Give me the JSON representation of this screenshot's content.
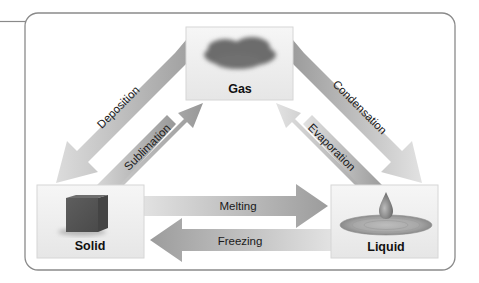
{
  "diagram": {
    "states": {
      "gas": {
        "label": "Gas",
        "icon": "cloud-icon"
      },
      "solid": {
        "label": "Solid",
        "icon": "cube-icon"
      },
      "liquid": {
        "label": "Liquid",
        "icon": "droplet-icon"
      }
    },
    "transitions": {
      "deposition": {
        "label": "Deposition",
        "from": "Gas",
        "to": "Solid"
      },
      "sublimation": {
        "label": "Sublimation",
        "from": "Solid",
        "to": "Gas"
      },
      "condensation": {
        "label": "Condensation",
        "from": "Gas",
        "to": "Liquid"
      },
      "evaporation": {
        "label": "Evaporation",
        "from": "Liquid",
        "to": "Gas"
      },
      "melting": {
        "label": "Melting",
        "from": "Solid",
        "to": "Liquid"
      },
      "freezing": {
        "label": "Freezing",
        "from": "Liquid",
        "to": "Solid"
      }
    },
    "colors": {
      "frame_border": "#8a8a8a",
      "box_fill": "#efefef",
      "box_border": "#d8d8d8",
      "arrow_light": "#d2d2d2",
      "arrow_dark": "#9a9a9a",
      "cloud": "#6e6e6e",
      "cube": "#5a5a5a"
    }
  }
}
